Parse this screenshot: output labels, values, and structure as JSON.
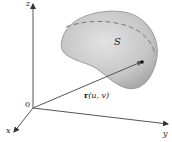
{
  "figure": {
    "labels": {
      "z_axis": "z",
      "x_axis": "x",
      "y_axis": "y",
      "origin": "0",
      "surface": "S",
      "vector_bold": "r",
      "vector_args": "(u, v)"
    },
    "colors": {
      "surface_fill": "#c4c4c4",
      "surface_edge": "#8a8a8a",
      "axis": "#555555",
      "dashed_curve": "#7a7a7a",
      "point": "#111111"
    }
  }
}
